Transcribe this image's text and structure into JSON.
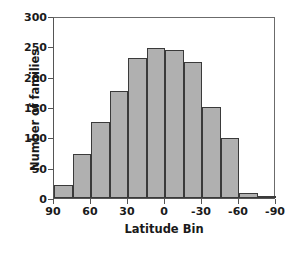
{
  "chart_data": {
    "type": "bar",
    "title": "",
    "subtitle": "",
    "xlabel": "Latitude Bin",
    "ylabel": "Number of families",
    "categories": [
      "90",
      "75",
      "60",
      "45",
      "30",
      "15",
      "0",
      "-15",
      "-30",
      "-45",
      "-60",
      "-75"
    ],
    "bin_left_edges": [
      90,
      75,
      60,
      45,
      30,
      15,
      0,
      -15,
      -30,
      -45,
      -60,
      -75
    ],
    "bin_width": 15,
    "values": [
      22,
      73,
      126,
      176,
      231,
      247,
      244,
      225,
      150,
      99,
      8,
      1
    ],
    "xlim": [
      90,
      -90
    ],
    "ylim": [
      0,
      300
    ],
    "xticks": [
      90,
      60,
      30,
      0,
      -30,
      -60,
      -90
    ],
    "xticklabels": [
      "90",
      "60",
      "30",
      "0",
      "-30",
      "-60",
      "-90"
    ],
    "yticks": [
      0,
      50,
      100,
      150,
      200,
      250,
      300
    ],
    "yticklabels": [
      "0",
      "50",
      "100",
      "150",
      "200",
      "250",
      "300"
    ],
    "grid": false,
    "legend": false,
    "legend_position": "none",
    "bar_fill_color": "#b0b0b0",
    "bar_edge_color": "#3a3a3a",
    "axis_color": "#555555",
    "text_color": "#1a1a1a",
    "background_color": "#ffffff",
    "x_axis_direction": "reversed"
  }
}
